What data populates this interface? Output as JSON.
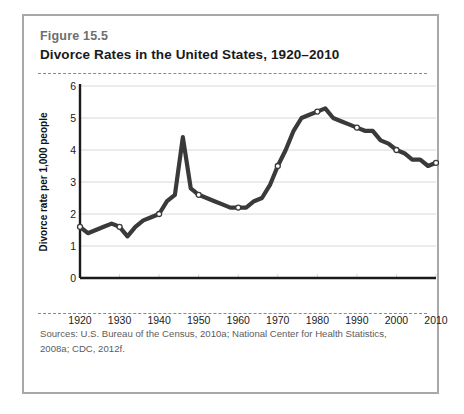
{
  "figure": {
    "number": "Figure 15.5",
    "title": "Divorce Rates in the United States, 1920–2010",
    "sources": "Sources:  U.S. Bureau of the Census, 2010a; National Center for Health Statistics, 2008a; CDC, 2012f."
  },
  "colors": {
    "line": "#3a3a3a",
    "marker_fill": "#ffffff",
    "axis": "#1a1a1a",
    "gridline": "#d8d8d8",
    "border": "#a8a8a8",
    "fig_number": "#6e6e6e",
    "sources_text": "#5c5c5c"
  },
  "chart_data": {
    "type": "line",
    "title": "Divorce Rates in the United States, 1920–2010",
    "xlabel": "",
    "ylabel": "Divorce rate per 1,000 people",
    "xlim": [
      1920,
      2010
    ],
    "ylim": [
      0,
      6
    ],
    "grid": true,
    "legend": null,
    "xticks": [
      1920,
      1930,
      1940,
      1950,
      1960,
      1970,
      1980,
      1990,
      2000,
      2010
    ],
    "yticks": [
      0,
      1,
      2,
      3,
      4,
      5,
      6
    ],
    "marker_years": [
      1920,
      1930,
      1940,
      1950,
      1960,
      1970,
      1980,
      1990,
      2000,
      2010
    ],
    "series": [
      {
        "name": "Divorce rate per 1,000 people",
        "x": [
          1920,
          1922,
          1924,
          1926,
          1928,
          1930,
          1932,
          1934,
          1936,
          1938,
          1940,
          1942,
          1944,
          1946,
          1948,
          1950,
          1952,
          1954,
          1956,
          1958,
          1960,
          1962,
          1964,
          1966,
          1968,
          1970,
          1972,
          1974,
          1976,
          1978,
          1980,
          1982,
          1984,
          1986,
          1988,
          1990,
          1992,
          1994,
          1996,
          1998,
          2000,
          2002,
          2004,
          2006,
          2008,
          2010
        ],
        "values": [
          1.6,
          1.4,
          1.5,
          1.6,
          1.7,
          1.6,
          1.3,
          1.6,
          1.8,
          1.9,
          2.0,
          2.4,
          2.6,
          4.4,
          2.8,
          2.6,
          2.5,
          2.4,
          2.3,
          2.2,
          2.2,
          2.2,
          2.4,
          2.5,
          2.9,
          3.5,
          4.0,
          4.6,
          5.0,
          5.1,
          5.2,
          5.3,
          5.0,
          4.9,
          4.8,
          4.7,
          4.6,
          4.6,
          4.3,
          4.2,
          4.0,
          3.9,
          3.7,
          3.7,
          3.5,
          3.6
        ]
      }
    ],
    "annotations": [
      {
        "label": "post-WWII peak",
        "year": 1946,
        "value": 4.4
      },
      {
        "label": "Great Depression low",
        "year": 1932,
        "value": 1.3
      },
      {
        "label": "1980 high",
        "year": 1980,
        "value": 5.2
      }
    ]
  }
}
